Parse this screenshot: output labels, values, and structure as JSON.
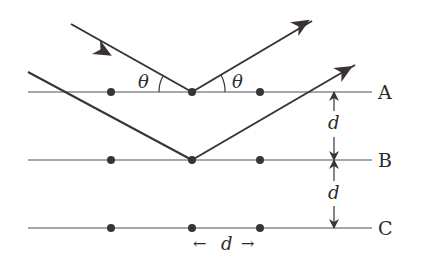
{
  "diagram": {
    "planes": [
      {
        "label": "A",
        "y": 92
      },
      {
        "label": "B",
        "y": 160
      },
      {
        "label": "C",
        "y": 228
      }
    ],
    "atom_x": [
      111,
      192,
      260
    ],
    "angle_symbol": "θ",
    "spacing_symbol": "d",
    "left_arrow": "←",
    "right_arrow": "→",
    "colors": {
      "line": "#8a8a8a",
      "ray": "#3a3236",
      "atom": "#3a3236",
      "text": "#2a2a2a"
    }
  }
}
